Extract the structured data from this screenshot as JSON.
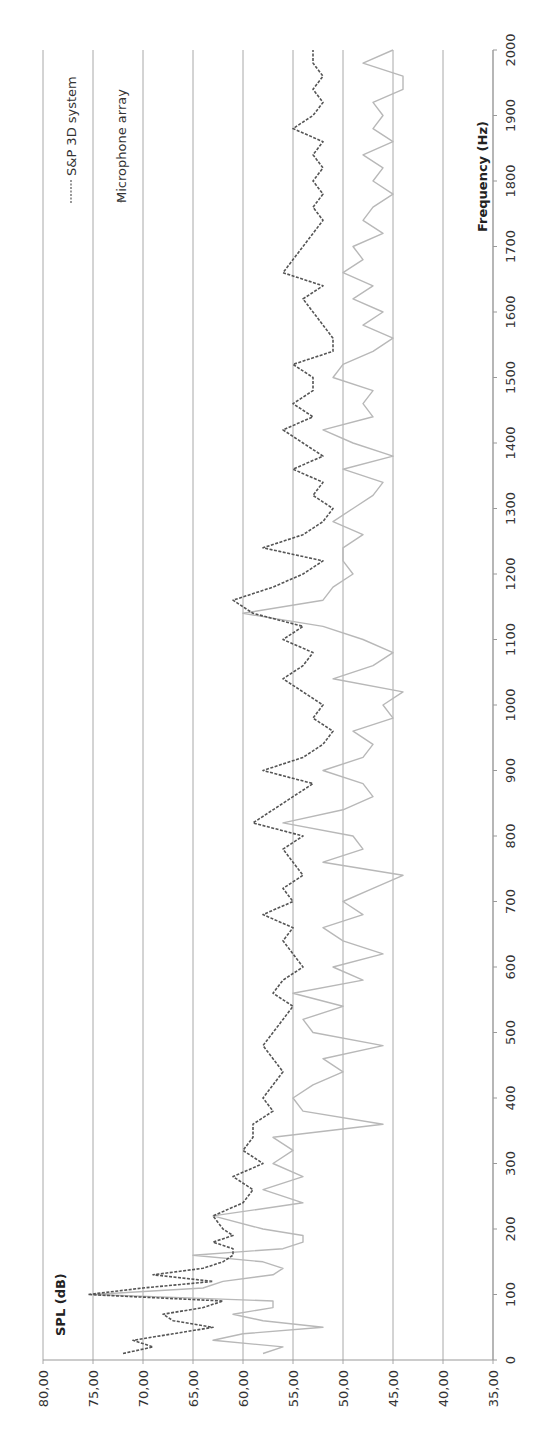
{
  "chart_data": {
    "type": "line",
    "orientation": "rotated-90-ccw",
    "title": "",
    "xlabel": "Frequency (Hz)",
    "ylabel": "SPL (dB)",
    "xlim": [
      0,
      2000
    ],
    "ylim": [
      35,
      80
    ],
    "x_ticks": [
      "0",
      "100",
      "200",
      "300",
      "400",
      "500",
      "600",
      "700",
      "800",
      "900",
      "1000",
      "1100",
      "1200",
      "1300",
      "1400",
      "1500",
      "1600",
      "1700",
      "1800",
      "1900",
      "2000"
    ],
    "y_ticks": [
      "80,00",
      "75,00",
      "70,00",
      "65,00",
      "60,00",
      "55,00",
      "50,00",
      "45,00",
      "40,00",
      "35,00"
    ],
    "grid": true,
    "legend_position": "top-left",
    "x": [
      10,
      20,
      30,
      40,
      50,
      60,
      70,
      80,
      90,
      100,
      110,
      120,
      130,
      140,
      150,
      160,
      170,
      180,
      190,
      200,
      220,
      240,
      260,
      280,
      300,
      320,
      340,
      360,
      380,
      400,
      420,
      440,
      460,
      480,
      500,
      520,
      540,
      560,
      580,
      600,
      620,
      640,
      660,
      680,
      700,
      720,
      740,
      760,
      780,
      800,
      820,
      840,
      860,
      880,
      900,
      920,
      940,
      960,
      980,
      1000,
      1020,
      1040,
      1060,
      1080,
      1100,
      1120,
      1140,
      1160,
      1180,
      1200,
      1220,
      1240,
      1260,
      1280,
      1300,
      1320,
      1340,
      1360,
      1380,
      1400,
      1420,
      1440,
      1460,
      1480,
      1500,
      1520,
      1540,
      1560,
      1580,
      1600,
      1620,
      1640,
      1660,
      1680,
      1700,
      1720,
      1740,
      1760,
      1780,
      1800,
      1820,
      1840,
      1860,
      1880,
      1900,
      1920,
      1940,
      1960,
      1980,
      2000
    ],
    "series": [
      {
        "name": "S&P 3D system",
        "style": "dashed",
        "color": "#555555",
        "values": [
          72,
          69,
          71,
          67,
          63,
          67,
          68,
          64,
          62,
          75.5,
          70,
          63,
          69,
          64,
          62,
          61,
          61,
          63,
          61,
          62,
          63,
          60,
          59,
          61,
          58,
          60,
          59,
          59,
          57,
          58,
          57,
          56,
          57,
          58,
          57,
          56,
          55,
          57,
          56,
          54,
          55,
          56,
          55,
          58,
          55,
          56,
          54,
          55,
          56,
          54,
          59,
          57,
          55,
          53,
          58,
          54,
          52,
          51,
          53,
          52,
          54,
          56,
          54,
          53,
          56,
          54,
          59,
          61,
          57,
          54,
          52,
          58,
          54,
          52,
          51,
          53,
          52,
          55,
          52,
          54,
          56,
          53,
          55,
          53,
          53,
          55,
          51,
          51,
          52,
          53,
          54,
          52,
          56,
          55,
          54,
          53,
          52,
          53,
          52,
          53,
          52,
          53,
          52,
          55,
          53,
          52,
          53,
          52,
          53,
          53
        ]
      },
      {
        "name": "Microphone array",
        "style": "solid",
        "color": "#b8b8b8",
        "values": [
          58,
          56,
          63,
          60,
          52,
          58,
          61,
          57,
          57,
          75,
          64,
          62,
          57,
          56,
          58,
          65,
          56,
          54,
          54,
          58,
          63,
          54,
          58,
          54,
          57,
          55,
          57,
          46,
          54,
          55,
          53,
          50,
          52,
          46,
          53,
          54,
          50,
          55,
          48,
          51,
          46,
          50,
          52,
          48,
          50,
          47,
          44,
          52,
          48,
          49,
          56,
          50,
          47,
          48,
          52,
          48,
          47,
          49,
          45,
          46,
          44,
          51,
          47,
          45,
          48,
          52,
          60,
          52,
          51,
          49,
          50,
          50,
          48,
          51,
          49,
          47,
          46,
          50,
          45,
          49,
          52,
          47,
          48,
          47,
          51,
          50,
          47,
          45,
          48,
          46,
          49,
          47,
          50,
          48,
          49,
          46,
          48,
          47,
          45,
          47,
          46,
          48,
          45,
          47,
          46,
          47,
          44,
          44,
          48,
          45
        ]
      }
    ]
  }
}
